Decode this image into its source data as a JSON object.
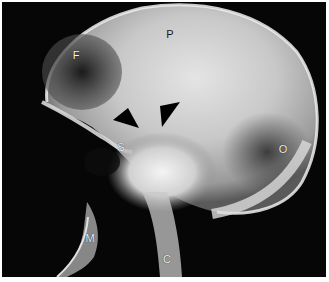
{
  "figure": {
    "type": "lateral skull radiograph",
    "background_color": "#060606",
    "border_color": "#ffffff",
    "labels": [
      {
        "id": "frontal",
        "text": "F",
        "x": 76,
        "y": 55
      },
      {
        "id": "parietal",
        "text": "P",
        "x": 170,
        "y": 34
      },
      {
        "id": "sella",
        "text": "S",
        "x": 121,
        "y": 147
      },
      {
        "id": "occipital",
        "text": "O",
        "x": 283,
        "y": 149
      },
      {
        "id": "mandible",
        "text": "M",
        "x": 90,
        "y": 238
      },
      {
        "id": "cervical",
        "text": "C",
        "x": 167,
        "y": 259
      }
    ],
    "arrowheads": [
      {
        "id": "arrowhead-left",
        "direction": "down-right",
        "color": "#000000"
      },
      {
        "id": "arrowhead-right",
        "direction": "down-left",
        "color": "#000000"
      }
    ]
  }
}
